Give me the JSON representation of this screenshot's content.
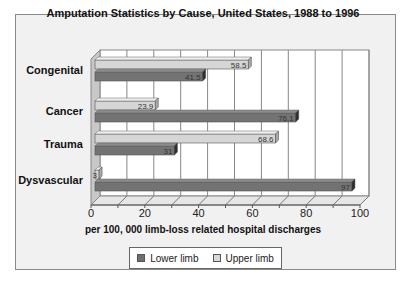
{
  "chart_data": {
    "type": "bar",
    "orientation": "horizontal",
    "style": "3d",
    "title": "Amputation Statistics by Cause, United States, 1988 to 1996",
    "xlabel": "per 100, 000 limb-loss related hospital discharges",
    "ylabel": "",
    "categories": [
      "Congenital",
      "Cancer",
      "Trauma",
      "Dysvascular"
    ],
    "series": [
      {
        "name": "Lower limb",
        "color": "#6e6e6e",
        "values": [
          41.5,
          76.1,
          31,
          97
        ]
      },
      {
        "name": "Upper limb",
        "color": "#cfcfcf",
        "values": [
          58.5,
          23.9,
          68.6,
          3
        ]
      }
    ],
    "data_labels": {
      "Lower limb": [
        "41.5",
        "76.1",
        "31",
        "97"
      ],
      "Upper limb": [
        "58.5",
        "23.9",
        "68.6",
        "3"
      ]
    },
    "xlim": [
      0,
      100
    ],
    "xticks": [
      "0",
      "20",
      "40",
      "60",
      "80",
      "100"
    ],
    "grid": true,
    "legend_position": "bottom"
  },
  "legend": {
    "lower": "Lower limb",
    "upper": "Upper limb"
  }
}
